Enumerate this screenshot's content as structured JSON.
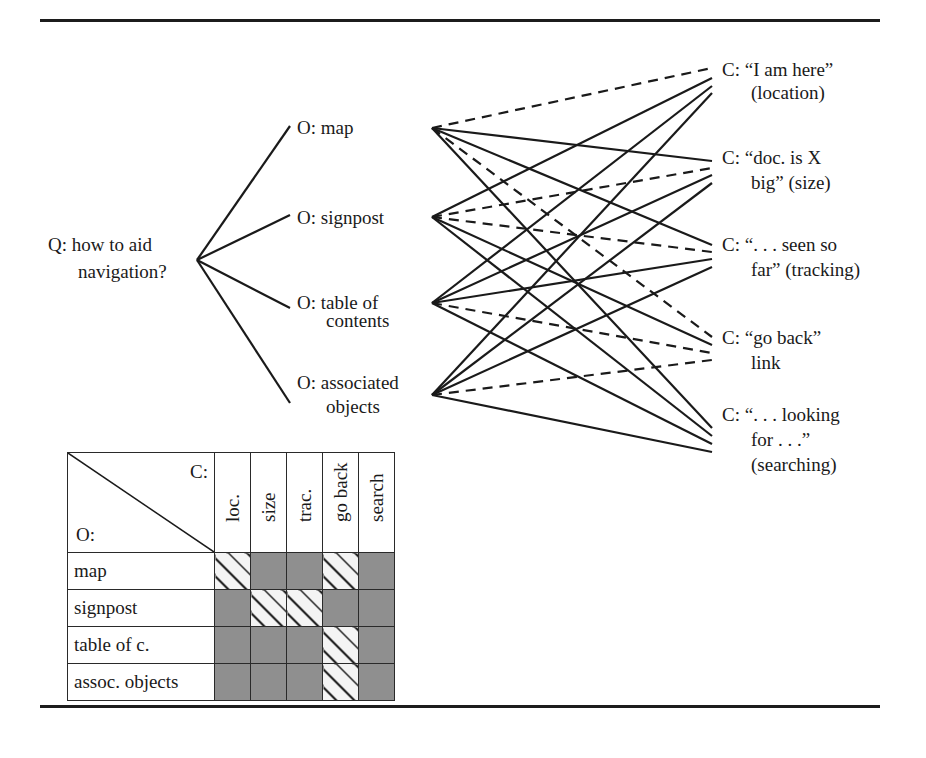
{
  "question": {
    "lines": [
      "Q: how to aid",
      "navigation?"
    ]
  },
  "options": [
    {
      "id": "map",
      "lines": [
        "O: map"
      ]
    },
    {
      "id": "signpost",
      "lines": [
        "O: signpost"
      ]
    },
    {
      "id": "toc",
      "lines": [
        "O: table of",
        "contents"
      ]
    },
    {
      "id": "assoc",
      "lines": [
        "O: associated",
        "objects"
      ]
    }
  ],
  "criteria": [
    {
      "id": "loc",
      "lines": [
        "C: “I am here”",
        "(location)"
      ]
    },
    {
      "id": "size",
      "lines": [
        "C: “doc. is X",
        "big” (size)"
      ]
    },
    {
      "id": "trac",
      "lines": [
        "C: “. . . seen so",
        "far” (tracking)"
      ]
    },
    {
      "id": "goback",
      "lines": [
        "C: “go back”",
        "link"
      ]
    },
    {
      "id": "search",
      "lines": [
        "C: “. . . looking",
        "for . . .”",
        "(searching)"
      ]
    }
  ],
  "edge_legend": {
    "dashed": "positive",
    "solid": "negative"
  },
  "edges": [
    {
      "from": "map",
      "to": "loc",
      "style": "dashed"
    },
    {
      "from": "map",
      "to": "size",
      "style": "solid"
    },
    {
      "from": "map",
      "to": "trac",
      "style": "solid"
    },
    {
      "from": "map",
      "to": "goback",
      "style": "dashed"
    },
    {
      "from": "map",
      "to": "search",
      "style": "solid"
    },
    {
      "from": "signpost",
      "to": "loc",
      "style": "solid"
    },
    {
      "from": "signpost",
      "to": "size",
      "style": "dashed"
    },
    {
      "from": "signpost",
      "to": "trac",
      "style": "dashed"
    },
    {
      "from": "signpost",
      "to": "goback",
      "style": "solid"
    },
    {
      "from": "signpost",
      "to": "search",
      "style": "solid"
    },
    {
      "from": "toc",
      "to": "loc",
      "style": "solid"
    },
    {
      "from": "toc",
      "to": "size",
      "style": "solid"
    },
    {
      "from": "toc",
      "to": "trac",
      "style": "solid"
    },
    {
      "from": "toc",
      "to": "goback",
      "style": "dashed"
    },
    {
      "from": "toc",
      "to": "search",
      "style": "solid"
    },
    {
      "from": "assoc",
      "to": "loc",
      "style": "solid"
    },
    {
      "from": "assoc",
      "to": "size",
      "style": "solid"
    },
    {
      "from": "assoc",
      "to": "trac",
      "style": "solid"
    },
    {
      "from": "assoc",
      "to": "goback",
      "style": "dashed"
    },
    {
      "from": "assoc",
      "to": "search",
      "style": "solid"
    }
  ],
  "matrix": {
    "corner_c": "C:",
    "corner_o": "O:",
    "columns": [
      "loc.",
      "size",
      "trac.",
      "go back",
      "search"
    ],
    "rows": [
      {
        "label": "map",
        "cells": [
          "pos",
          "neg",
          "neg",
          "pos",
          "neg"
        ]
      },
      {
        "label": "signpost",
        "cells": [
          "neg",
          "pos",
          "pos",
          "neg",
          "neg"
        ]
      },
      {
        "label": "table of c.",
        "cells": [
          "neg",
          "neg",
          "neg",
          "pos",
          "neg"
        ]
      },
      {
        "label": "assoc. objects",
        "cells": [
          "neg",
          "neg",
          "neg",
          "pos",
          "neg"
        ]
      }
    ]
  },
  "colors": {
    "line": "#1a1a1a",
    "negative_cell": "#8f8f8f",
    "positive_cell_bg": "#f4f4f4"
  }
}
